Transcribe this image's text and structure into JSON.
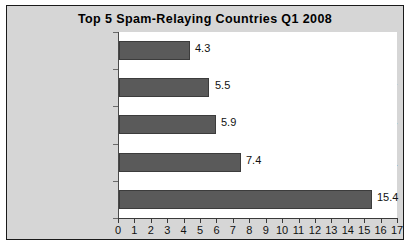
{
  "chart_data": {
    "type": "bar",
    "orientation": "horizontal",
    "title": "Top 5 Spam-Relaying Countries Q1 2008",
    "xlabel": "",
    "ylabel": "",
    "categories": [
      "Brazil",
      "China\n(inc. Hong Kong)",
      "Turkey",
      "Russia",
      "United States"
    ],
    "category_lines": [
      [
        "Brazil"
      ],
      [
        "China",
        "(inc. Hong Kong)"
      ],
      [
        "Turkey"
      ],
      [
        "Russia"
      ],
      [
        "United States"
      ]
    ],
    "values": [
      4.3,
      5.5,
      5.9,
      7.4,
      15.4
    ],
    "value_labels": [
      "4.3",
      "5.5",
      "5.9",
      "7.4",
      "15.4"
    ],
    "xlim": [
      0,
      17
    ],
    "xticks": [
      0,
      1,
      2,
      3,
      4,
      5,
      6,
      7,
      8,
      9,
      10,
      11,
      12,
      13,
      14,
      15,
      16,
      17
    ],
    "xtick_labels": [
      "0",
      "1",
      "2",
      "3",
      "4",
      "5",
      "6",
      "7",
      "8",
      "9",
      "10",
      "11",
      "12",
      "13",
      "14",
      "15",
      "16",
      "17"
    ],
    "grid": false,
    "legend": false,
    "colors": {
      "bar_fill": "#5a5a5a",
      "bar_border": "#3c3c3c",
      "figure_background": "#d6d6d6",
      "plot_background": "#ffffff",
      "axis": "#3a3a3a",
      "text": "#111111",
      "frame_border": "#1a1a1a"
    }
  }
}
